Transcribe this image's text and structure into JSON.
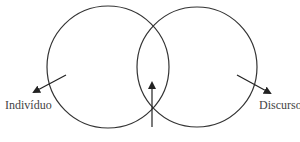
{
  "diagram": {
    "type": "venn",
    "circles": [
      {
        "name": "left",
        "cx": 108,
        "cy": 67,
        "r": 61
      },
      {
        "name": "right",
        "cx": 197,
        "cy": 67,
        "r": 60
      }
    ],
    "stroke_color": "#333333",
    "labels": {
      "left": "Indivíduo",
      "right": "Discurso",
      "bottom": ""
    },
    "arrows": [
      {
        "name": "left-arrow",
        "x1": 66,
        "y1": 75,
        "x2": 34,
        "y2": 92
      },
      {
        "name": "right-arrow",
        "x1": 237,
        "y1": 75,
        "x2": 270,
        "y2": 93
      },
      {
        "name": "center-arrow",
        "x1": 152,
        "y1": 127,
        "x2": 152,
        "y2": 83
      }
    ]
  }
}
